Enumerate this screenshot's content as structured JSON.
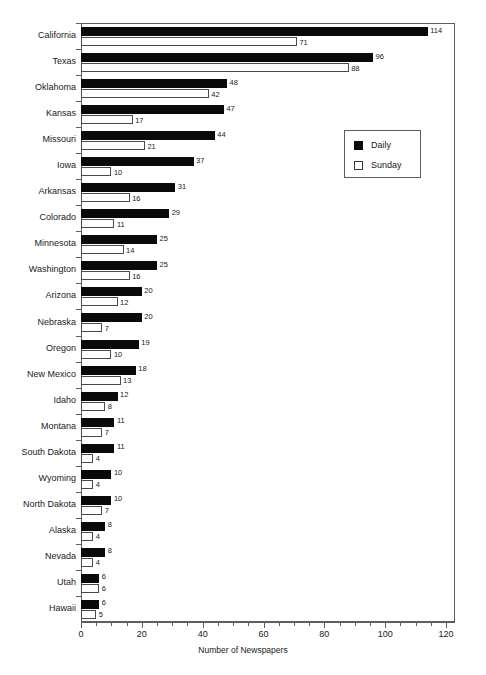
{
  "chart_data": {
    "type": "bar",
    "orientation": "horizontal",
    "title": "",
    "xlabel": "Number of Newspapers",
    "ylabel": "",
    "xlim": [
      0,
      120
    ],
    "xticks": [
      0,
      20,
      40,
      60,
      80,
      100,
      120
    ],
    "xtick_labels": [
      "0",
      "20",
      "40",
      "60",
      "80",
      "100",
      "120"
    ],
    "minor_tick_step": 5,
    "grid": false,
    "legend_position": "upper right",
    "legend": [
      "Daily",
      "Sunday"
    ],
    "colors": {
      "daily": "#0a0a0a",
      "sunday": "#ffffff",
      "sunday_edge": "#4a4a4a",
      "axis": "#5d5d5d",
      "text": "#1a1a1a",
      "background": "#ffffff"
    },
    "categories": [
      "California",
      "Texas",
      "Oklahoma",
      "Kansas",
      "Missouri",
      "Iowa",
      "Arkansas",
      "Colorado",
      "Minnesota",
      "Washington",
      "Arizona",
      "Nebraska",
      "Oregon",
      "New Mexico",
      "Idaho",
      "Montana",
      "South Dakota",
      "Wyoming",
      "North Dakota",
      "Alaska",
      "Nevada",
      "Utah",
      "Hawaii"
    ],
    "series": [
      {
        "name": "Daily",
        "values": [
          114,
          96,
          48,
          47,
          44,
          37,
          31,
          29,
          25,
          25,
          20,
          20,
          19,
          18,
          12,
          11,
          11,
          10,
          10,
          8,
          8,
          6,
          6
        ]
      },
      {
        "name": "Sunday",
        "values": [
          71,
          88,
          42,
          17,
          21,
          10,
          16,
          11,
          14,
          16,
          12,
          7,
          10,
          13,
          8,
          7,
          4,
          4,
          7,
          4,
          4,
          6,
          5
        ]
      }
    ]
  }
}
